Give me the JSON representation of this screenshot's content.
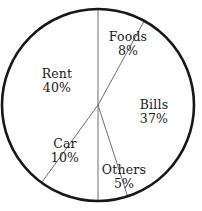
{
  "chart_data": {
    "type": "pie",
    "title": "",
    "subtitle": "",
    "xlabel": "",
    "ylabel": "",
    "legend": "none",
    "grid": false,
    "start_angle_deg": 0,
    "direction": "clockwise",
    "total_percent": 100,
    "categories": [
      "Foods",
      "Bills",
      "Others",
      "Car",
      "Rent"
    ],
    "values": [
      8,
      37,
      5,
      10,
      40
    ],
    "value_suffix": "%",
    "slices": [
      {
        "label": "Foods",
        "value": 8,
        "value_text": "8%",
        "start_deg": 0,
        "end_deg": 28.8,
        "label_x": 128,
        "label_y": 44,
        "fill": "#ffffff"
      },
      {
        "label": "Bills",
        "value": 37,
        "value_text": "37%",
        "start_deg": 28.8,
        "end_deg": 162.0,
        "label_x": 154,
        "label_y": 112,
        "fill": "#ffffff"
      },
      {
        "label": "Others",
        "value": 5,
        "value_text": "5%",
        "start_deg": 162.0,
        "end_deg": 180.0,
        "label_x": 124,
        "label_y": 177,
        "fill": "#ffffff"
      },
      {
        "label": "Car",
        "value": 10,
        "value_text": "10%",
        "start_deg": 180.0,
        "end_deg": 216.0,
        "label_x": 65,
        "label_y": 151,
        "fill": "#ffffff"
      },
      {
        "label": "Rent",
        "value": 40,
        "value_text": "40%",
        "start_deg": 216.0,
        "end_deg": 360.0,
        "label_x": 57,
        "label_y": 81,
        "fill": "#ffffff"
      }
    ],
    "geometry": {
      "center_x": 98,
      "center_y": 105,
      "radius": 96,
      "outline_color": "#171717",
      "divider_color": "#6e6e6e",
      "background": "#ffffff"
    }
  }
}
